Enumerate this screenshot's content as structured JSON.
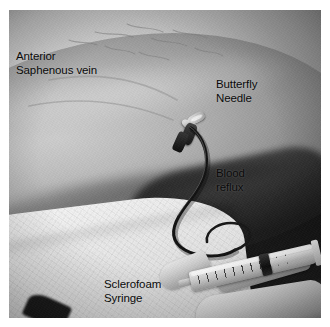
{
  "figure": {
    "kind": "clinical-photograph",
    "modality": "grayscale photograph",
    "plate_background": "#ffffff"
  },
  "annotations": [
    {
      "id": "anterior-saphenous-vein",
      "text": "Anterior\nSaphenous vein",
      "lines": [
        "Anterior",
        "Saphenous vein"
      ],
      "color": "#0a0a0a",
      "position": "upper-left"
    },
    {
      "id": "butterfly-needle",
      "text": "Butterfly\nNeedle",
      "lines": [
        "Butterfly",
        "Needle"
      ],
      "color": "#0a0a0a",
      "position": "upper-right"
    },
    {
      "id": "blood-reflux",
      "text": "Blood\nreflux",
      "lines": [
        "Blood",
        "reflux"
      ],
      "color": "#0a0a0a",
      "position": "middle-right"
    },
    {
      "id": "sclerofoam-syringe",
      "text": "Sclerofoam\nSyringe",
      "lines": [
        "Sclerofoam",
        "Syringe"
      ],
      "color": "#0a0a0a",
      "position": "lower-left"
    }
  ],
  "scene": {
    "leg_label": "patient-leg",
    "far_leg_label": "far-leg",
    "drape_label": "surgical-drape",
    "needle_label": "butterfly-needle-device",
    "tubing_label": "extension-tubing",
    "syringe_label": "sclerofoam-syringe-device",
    "hand_label": "clinician-hand"
  },
  "palette": {
    "photo_mid_gray": "#8e8e8e",
    "photo_dark_gray": "#4c4c4c",
    "skin_highlight": "#cbcbcb",
    "drape_white": "#f2f2f2",
    "device_dark": "#171717",
    "annotation_text": "#0a0a0a"
  }
}
